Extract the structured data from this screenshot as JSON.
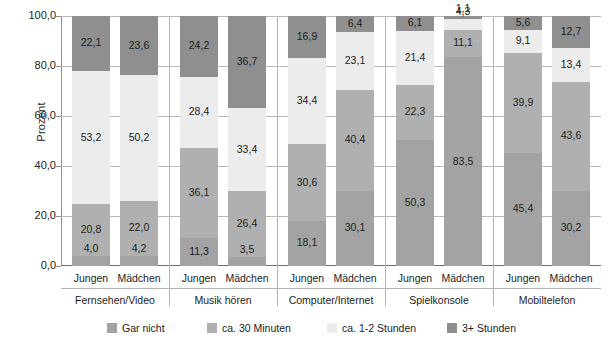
{
  "chart_data": {
    "type": "bar",
    "stacked": true,
    "title": "",
    "xlabel": "",
    "ylabel": "Prozent",
    "ylim": [
      0,
      100
    ],
    "yticks": [
      "0,0",
      "20,0",
      "40,0",
      "60,0",
      "80,0",
      "100,0"
    ],
    "ytick_values": [
      0,
      20,
      40,
      60,
      80,
      100
    ],
    "grid": true,
    "legend_position": "bottom",
    "series": [
      {
        "name": "Gar nicht",
        "color": "#a3a3a3"
      },
      {
        "name": "ca. 30 Minuten",
        "color": "#b0b0b0"
      },
      {
        "name": "ca. 1-2 Stunden",
        "color": "#ececec"
      },
      {
        "name": "3+ Stunden",
        "color": "#8f8f8f"
      }
    ],
    "groups": [
      {
        "name": "Fernsehen/Video",
        "bars": [
          {
            "name": "Jungen",
            "values": [
              4.0,
              20.8,
              53.2,
              22.1
            ],
            "labels": [
              "4,0",
              "20,8",
              "53,2",
              "22,1"
            ]
          },
          {
            "name": "Mädchen",
            "values": [
              4.2,
              22.0,
              50.2,
              23.6
            ],
            "labels": [
              "4,2",
              "22,0",
              "50,2",
              "23,6"
            ]
          }
        ]
      },
      {
        "name": "Musik hören",
        "bars": [
          {
            "name": "Jungen",
            "values": [
              11.3,
              36.1,
              28.4,
              24.2
            ],
            "labels": [
              "11,3",
              "36,1",
              "28,4",
              "24,2"
            ]
          },
          {
            "name": "Mädchen",
            "values": [
              3.5,
              26.4,
              33.4,
              36.7
            ],
            "labels": [
              "3,5",
              "26,4",
              "33,4",
              "36,7"
            ]
          }
        ]
      },
      {
        "name": "Computer/Internet",
        "bars": [
          {
            "name": "Jungen",
            "values": [
              18.1,
              30.6,
              34.4,
              16.9
            ],
            "labels": [
              "18,1",
              "30,6",
              "34,4",
              "16,9"
            ]
          },
          {
            "name": "Mädchen",
            "values": [
              30.1,
              40.4,
              23.1,
              6.4
            ],
            "labels": [
              "30,1",
              "40,4",
              "23,1",
              "6,4"
            ]
          }
        ]
      },
      {
        "name": "Spielkonsole",
        "bars": [
          {
            "name": "Jungen",
            "values": [
              50.3,
              22.3,
              21.4,
              6.1
            ],
            "labels": [
              "50,3",
              "22,3",
              "21,4",
              "6,1"
            ]
          },
          {
            "name": "Mädchen",
            "values": [
              83.5,
              11.1,
              4.3,
              1.1
            ],
            "labels": [
              "83,5",
              "11,1",
              "4,3",
              "1,1"
            ]
          }
        ]
      },
      {
        "name": "Mobiltelefon",
        "bars": [
          {
            "name": "Jungen",
            "values": [
              45.4,
              39.9,
              9.1,
              5.6
            ],
            "labels": [
              "45,4",
              "39,9",
              "9,1",
              "5,6"
            ]
          },
          {
            "name": "Mädchen",
            "values": [
              30.2,
              43.6,
              13.4,
              12.7
            ],
            "labels": [
              "30,2",
              "43,6",
              "13,4",
              "12,7"
            ]
          }
        ]
      }
    ]
  },
  "legend": {
    "items": [
      {
        "label": "Gar nicht"
      },
      {
        "label": "ca. 30 Minuten"
      },
      {
        "label": "ca. 1-2 Stunden"
      },
      {
        "label": "3+ Stunden"
      }
    ]
  }
}
